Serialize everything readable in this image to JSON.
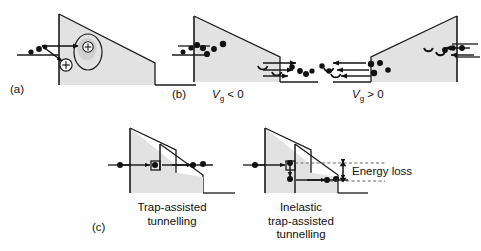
{
  "figure": {
    "type": "energy-band-diagram",
    "background_color": "#ffffff",
    "barrier_fill_color": "#e2e2e2",
    "line_color": "#1a1a1a",
    "carrier_color": "#111111"
  },
  "panels": [
    {
      "id": "a",
      "letter": "(a)",
      "caption": "",
      "diagrams": [
        {
          "name": "exciton-generation",
          "carriers": {
            "electrons": 3,
            "holes": 2,
            "exciton": true
          },
          "arrows": 2
        }
      ]
    },
    {
      "id": "b",
      "letter": "(b)",
      "caption": "",
      "diagrams": [
        {
          "name": "negative-gate-bias",
          "label": "Vg < 0",
          "label_symbol": "V",
          "label_subscript": "g",
          "label_relation": "< 0",
          "electrons_left": 5,
          "electrons_right": 6,
          "holes_right": 2,
          "arrows": 3
        },
        {
          "name": "positive-gate-bias",
          "label": "Vg > 0",
          "label_symbol": "V",
          "label_subscript": "g",
          "label_relation": "> 0",
          "electrons_left": 6,
          "electrons_right": 4,
          "holes_right": 2,
          "arrows": 3
        }
      ]
    },
    {
      "id": "c",
      "letter": "(c)",
      "caption": "",
      "diagrams": [
        {
          "name": "trap-assisted-tunnelling",
          "caption_line1": "Trap-assisted",
          "caption_line2": "tunnelling",
          "caption_full": "Trap-assisted tunnelling",
          "trap_marker": "square",
          "electrons": 4,
          "arrows": 3
        },
        {
          "name": "inelastic-trap-assisted-tunnelling",
          "caption_line1": "Inelastic",
          "caption_line2": "trap-assisted",
          "caption_line3": "tunnelling",
          "caption_full": "Inelastic trap-assisted tunnelling",
          "annotation": "Energy loss",
          "trap_marker": "square",
          "electrons": 4,
          "arrows": 4
        }
      ]
    }
  ],
  "annotations": {
    "energy_loss": "Energy loss"
  }
}
